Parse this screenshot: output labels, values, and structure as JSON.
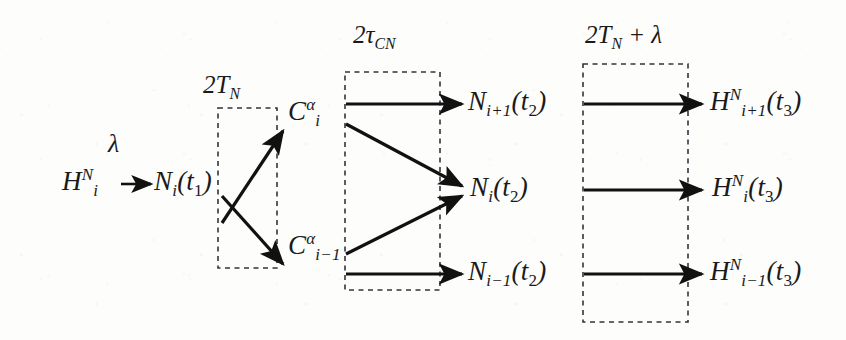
{
  "figure": {
    "kind": "reaction-timeline-diagram",
    "background_color": "#fdfdfc",
    "ink_color": "#111111",
    "dash_color": "#33333a",
    "width": 846,
    "height": 340
  },
  "stage_labels": [
    {
      "id": "stage-1",
      "text": "2T",
      "sub": "N",
      "full": "2T_N"
    },
    {
      "id": "stage-2",
      "text": "2τ",
      "sub": "CN",
      "full": "2τ_CN"
    },
    {
      "id": "stage-3",
      "text": "2T",
      "sub": "N",
      "suffix": " + λ",
      "full": "2T_N + λ"
    }
  ],
  "nodes": {
    "source": {
      "base": "H",
      "sup": "N",
      "sub": "i",
      "tail": "",
      "full": "H_i^N"
    },
    "rate_label": {
      "text": "λ"
    },
    "n_t1": {
      "base": "N",
      "sub": "i",
      "tail": "(t",
      "tail_sub": "1",
      "tail_end": ")",
      "full": "N_i(t_1)"
    },
    "c_upper": {
      "base": "C",
      "sup": "α",
      "sub": "i",
      "full": "C_i^α"
    },
    "c_lower": {
      "base": "C",
      "sup": "α",
      "sub": "i−1",
      "full": "C_{i-1}^α"
    },
    "n_upper_t2": {
      "base": "N",
      "sub": "i+1",
      "tail": "(t",
      "tail_sub": "2",
      "tail_end": ")",
      "full": "N_{i+1}(t_2)"
    },
    "n_mid_t2": {
      "base": "N",
      "sub": "i",
      "tail": "(t",
      "tail_sub": "2",
      "tail_end": ")",
      "full": "N_i(t_2)"
    },
    "n_lower_t2": {
      "base": "N",
      "sub": "i−1",
      "tail": "(t",
      "tail_sub": "2",
      "tail_end": ")",
      "full": "N_{i-1}(t_2)"
    },
    "h_upper_t3": {
      "base": "H",
      "sup": "N",
      "sub": "i+1",
      "tail": "(t",
      "tail_sub": "3",
      "tail_end": ")",
      "full": "H_{i+1}^N(t_3)"
    },
    "h_mid_t3": {
      "base": "H",
      "sup": "N",
      "sub": "i",
      "tail": "(t",
      "tail_sub": "3",
      "tail_end": ")",
      "full": "H_i^N(t_3)"
    },
    "h_lower_t3": {
      "base": "H",
      "sup": "N",
      "sub": "i−1",
      "tail": "(t",
      "tail_sub": "3",
      "tail_end": ")",
      "full": "H_{i-1}^N(t_3)"
    }
  },
  "edges": [
    {
      "id": "edge-h-to-n1",
      "from": "source",
      "to": "n_t1",
      "style": "short-arrow"
    },
    {
      "id": "edge-n1-to-cupper",
      "from": "n_t1",
      "to": "c_upper",
      "style": "diagonal-up"
    },
    {
      "id": "edge-n1-to-clower",
      "from": "n_t1",
      "to": "c_lower",
      "style": "diagonal-down"
    },
    {
      "id": "edge-cupper-to-nupper",
      "from": "c_upper",
      "to": "n_upper_t2",
      "style": "horizontal"
    },
    {
      "id": "edge-cupper-to-nmid",
      "from": "c_upper",
      "to": "n_mid_t2",
      "style": "diagonal-down"
    },
    {
      "id": "edge-clower-to-nmid",
      "from": "c_lower",
      "to": "n_mid_t2",
      "style": "diagonal-up"
    },
    {
      "id": "edge-clower-to-nlower",
      "from": "c_lower",
      "to": "n_lower_t2",
      "style": "horizontal"
    },
    {
      "id": "edge-nupper-to-hupper",
      "from": "n_upper_t2",
      "to": "h_upper_t3",
      "style": "horizontal"
    },
    {
      "id": "edge-nmid-to-hmid",
      "from": "n_mid_t2",
      "to": "h_mid_t3",
      "style": "horizontal"
    },
    {
      "id": "edge-nlower-to-hlower",
      "from": "n_lower_t2",
      "to": "h_lower_t3",
      "style": "horizontal"
    }
  ],
  "dashed_boxes": [
    {
      "id": "box-stage-1",
      "label": "2T_N",
      "x": 218,
      "y": 108,
      "width": 59,
      "height": 160
    },
    {
      "id": "box-stage-2",
      "label": "2τ_CN",
      "x": 345,
      "y": 72,
      "width": 95,
      "height": 218
    },
    {
      "id": "box-stage-3",
      "label": "2T_N + λ",
      "x": 583,
      "y": 64,
      "width": 105,
      "height": 258
    }
  ]
}
